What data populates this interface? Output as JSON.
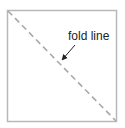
{
  "diagram": {
    "label": "fold line",
    "colors": {
      "border": "#b8b8b8",
      "fold_line": "#a8a8a8",
      "text": "#222222",
      "arrow": "#222222",
      "background": "#ffffff"
    },
    "square": {
      "x": 7.5,
      "y": 10.5,
      "width": 109,
      "height": 111
    },
    "fold_line": {
      "x1": 8,
      "y1": 11,
      "x2": 116,
      "y2": 121,
      "style": "dashed"
    }
  }
}
